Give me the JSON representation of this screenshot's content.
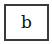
{
  "box": {
    "label": "b",
    "border_color": "#3a3a3a",
    "background": "#ffffff"
  }
}
